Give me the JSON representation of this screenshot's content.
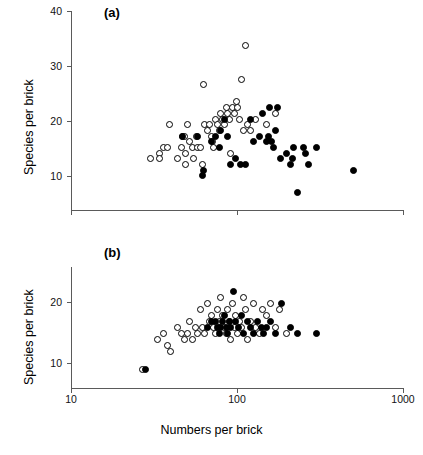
{
  "figure": {
    "xlabel": "Numbers per brick",
    "panels": [
      {
        "id": "a",
        "label": "(a)",
        "ylabel": "Species per brick",
        "yticks": [
          "40",
          "30",
          "20",
          "10"
        ]
      },
      {
        "id": "b",
        "label": "(b)",
        "ylabel": "Species per brick",
        "yticks": [
          "20",
          "10"
        ]
      }
    ],
    "xticks": [
      "10",
      "100",
      "1000"
    ]
  },
  "chart_data": [
    {
      "type": "scatter",
      "title": "(a)",
      "xlabel": "Numbers per brick",
      "ylabel": "Species per brick",
      "xscale": "log",
      "xlim": [
        10,
        1000
      ],
      "ylim": [
        5,
        40
      ],
      "grid": false,
      "legend": "none",
      "yticks": [
        10,
        20,
        30,
        40
      ],
      "xticks": [
        10,
        100,
        1000
      ],
      "series": [
        {
          "name": "open circles",
          "marker": "open-circle",
          "color": "#000000",
          "points": [
            [
              30,
              14
            ],
            [
              34,
              15
            ],
            [
              34,
              14
            ],
            [
              36,
              16
            ],
            [
              38,
              16
            ],
            [
              39,
              20
            ],
            [
              44,
              14
            ],
            [
              46,
              16
            ],
            [
              47,
              18
            ],
            [
              48,
              18
            ],
            [
              49,
              15
            ],
            [
              49,
              13
            ],
            [
              50,
              20
            ],
            [
              52,
              17
            ],
            [
              54,
              16
            ],
            [
              55,
              14
            ],
            [
              57,
              18
            ],
            [
              58,
              16
            ],
            [
              60,
              16
            ],
            [
              62,
              13
            ],
            [
              63,
              27
            ],
            [
              64,
              20
            ],
            [
              66,
              19
            ],
            [
              68,
              20
            ],
            [
              70,
              18
            ],
            [
              71,
              17
            ],
            [
              72,
              16
            ],
            [
              74,
              21
            ],
            [
              76,
              20
            ],
            [
              78,
              19
            ],
            [
              80,
              22
            ],
            [
              82,
              21
            ],
            [
              84,
              20
            ],
            [
              86,
              23
            ],
            [
              88,
              22
            ],
            [
              90,
              21
            ],
            [
              92,
              15
            ],
            [
              94,
              23
            ],
            [
              96,
              22
            ],
            [
              99,
              24
            ],
            [
              101,
              23
            ],
            [
              104,
              21
            ],
            [
              106,
              28
            ],
            [
              110,
              19
            ],
            [
              113,
              34
            ],
            [
              116,
              20
            ],
            [
              120,
              19
            ],
            [
              130,
              21
            ],
            [
              150,
              20
            ],
            [
              170,
              22
            ]
          ]
        },
        {
          "name": "filled circles",
          "marker": "filled-circle",
          "color": "#000000",
          "points": [
            [
              47,
              18
            ],
            [
              58,
              18
            ],
            [
              62,
              11
            ],
            [
              63,
              12
            ],
            [
              70,
              17
            ],
            [
              74,
              18
            ],
            [
              78,
              16
            ],
            [
              80,
              19
            ],
            [
              84,
              21
            ],
            [
              88,
              18
            ],
            [
              92,
              13
            ],
            [
              98,
              14
            ],
            [
              105,
              13
            ],
            [
              112,
              13
            ],
            [
              120,
              21
            ],
            [
              126,
              17
            ],
            [
              136,
              18
            ],
            [
              142,
              22
            ],
            [
              150,
              17
            ],
            [
              155,
              18
            ],
            [
              158,
              23
            ],
            [
              162,
              17
            ],
            [
              166,
              16
            ],
            [
              170,
              19
            ],
            [
              175,
              23
            ],
            [
              182,
              14
            ],
            [
              200,
              15
            ],
            [
              210,
              13
            ],
            [
              215,
              14
            ],
            [
              220,
              16
            ],
            [
              230,
              8
            ],
            [
              250,
              16
            ],
            [
              260,
              15
            ],
            [
              270,
              13
            ],
            [
              300,
              16
            ],
            [
              500,
              12
            ]
          ]
        }
      ]
    },
    {
      "type": "scatter",
      "title": "(b)",
      "xlabel": "Numbers per brick",
      "ylabel": "Species per brick",
      "xscale": "log",
      "xlim": [
        10,
        1000
      ],
      "ylim": [
        5,
        25
      ],
      "grid": false,
      "legend": "none",
      "yticks": [
        10,
        20
      ],
      "xticks": [
        10,
        100,
        1000
      ],
      "series": [
        {
          "name": "open circles",
          "marker": "open-circle",
          "color": "#000000",
          "points": [
            [
              27,
              8
            ],
            [
              33,
              13
            ],
            [
              36,
              14
            ],
            [
              38,
              12
            ],
            [
              40,
              11
            ],
            [
              44,
              15
            ],
            [
              46,
              14
            ],
            [
              48,
              13
            ],
            [
              50,
              14
            ],
            [
              52,
              16
            ],
            [
              54,
              13
            ],
            [
              56,
              15
            ],
            [
              58,
              14
            ],
            [
              60,
              18
            ],
            [
              62,
              15
            ],
            [
              64,
              14
            ],
            [
              66,
              19
            ],
            [
              68,
              16
            ],
            [
              70,
              17
            ],
            [
              72,
              15
            ],
            [
              74,
              14
            ],
            [
              76,
              18
            ],
            [
              78,
              16
            ],
            [
              80,
              20
            ],
            [
              82,
              17
            ],
            [
              84,
              15
            ],
            [
              86,
              14
            ],
            [
              88,
              18
            ],
            [
              90,
              16
            ],
            [
              92,
              13
            ],
            [
              94,
              19
            ],
            [
              96,
              15
            ],
            [
              98,
              17
            ],
            [
              100,
              14
            ],
            [
              103,
              16
            ],
            [
              106,
              15
            ],
            [
              110,
              20
            ],
            [
              113,
              18
            ],
            [
              116,
              13
            ],
            [
              120,
              16
            ],
            [
              126,
              19
            ],
            [
              130,
              15
            ],
            [
              136,
              14
            ],
            [
              142,
              18
            ],
            [
              150,
              17
            ],
            [
              160,
              19
            ],
            [
              170,
              15
            ],
            [
              180,
              18
            ],
            [
              200,
              14
            ]
          ]
        },
        {
          "name": "filled circles",
          "marker": "filled-circle",
          "color": "#000000",
          "points": [
            [
              28,
              8
            ],
            [
              66,
              15
            ],
            [
              70,
              16
            ],
            [
              74,
              16
            ],
            [
              76,
              15
            ],
            [
              78,
              14
            ],
            [
              80,
              15
            ],
            [
              82,
              16
            ],
            [
              84,
              17
            ],
            [
              86,
              15
            ],
            [
              88,
              14
            ],
            [
              90,
              16
            ],
            [
              92,
              15
            ],
            [
              95,
              21
            ],
            [
              98,
              16
            ],
            [
              102,
              15
            ],
            [
              106,
              17
            ],
            [
              110,
              14
            ],
            [
              115,
              16
            ],
            [
              120,
              15
            ],
            [
              126,
              14
            ],
            [
              132,
              16
            ],
            [
              140,
              15
            ],
            [
              145,
              14
            ],
            [
              150,
              15
            ],
            [
              160,
              16
            ],
            [
              170,
              14
            ],
            [
              185,
              19
            ],
            [
              210,
              15
            ],
            [
              230,
              14
            ],
            [
              300,
              14
            ]
          ]
        }
      ]
    }
  ]
}
